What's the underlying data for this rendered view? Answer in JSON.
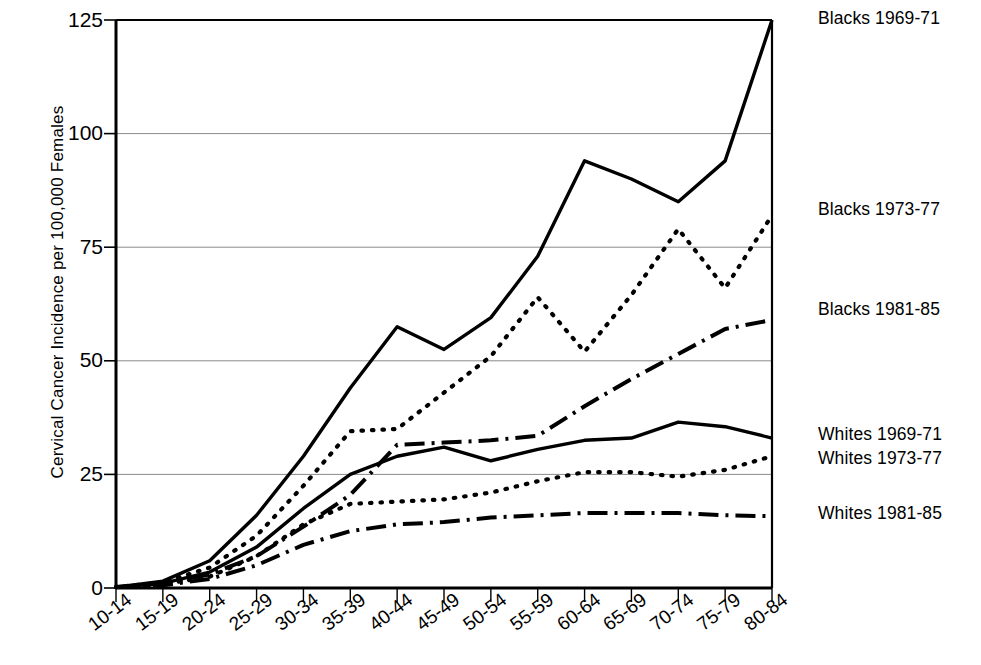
{
  "chart_data": {
    "type": "line",
    "title": "",
    "xlabel": "",
    "ylabel": "Cervical Cancer Incidence per 100,000 Females",
    "categories": [
      "10-14",
      "15-19",
      "20-24",
      "25-29",
      "30-34",
      "35-39",
      "40-44",
      "45-49",
      "50-54",
      "55-59",
      "60-64",
      "65-69",
      "70-74",
      "75-79",
      "80-84"
    ],
    "ylim": [
      0,
      125
    ],
    "yticks": [
      0,
      25,
      50,
      75,
      100,
      125
    ],
    "grid": true,
    "legend_position": "right",
    "series": [
      {
        "name": "Blacks 1969-71",
        "style": "solid",
        "values": [
          0.2,
          1.5,
          6.0,
          16.0,
          29.0,
          44.0,
          57.5,
          52.5,
          59.5,
          73.0,
          94.0,
          90.0,
          85.0,
          94.0,
          125.0
        ]
      },
      {
        "name": "Blacks 1973-77",
        "style": "dotted",
        "values": [
          0.2,
          1.2,
          4.5,
          11.5,
          22.5,
          34.5,
          35.0,
          43.0,
          51.0,
          64.0,
          52.0,
          64.5,
          79.0,
          66.0,
          82.0
        ]
      },
      {
        "name": "Blacks 1981-85",
        "style": "dash-dot",
        "values": [
          0.2,
          1.0,
          3.0,
          7.0,
          13.5,
          20.5,
          31.5,
          32.0,
          32.5,
          33.5,
          40.0,
          46.0,
          51.5,
          57.0,
          59.0
        ]
      },
      {
        "name": "Whites 1969-71",
        "style": "solid",
        "values": [
          0.2,
          1.0,
          3.5,
          9.0,
          17.5,
          25.0,
          29.0,
          31.0,
          28.0,
          30.5,
          32.5,
          33.0,
          36.5,
          35.5,
          33.0
        ]
      },
      {
        "name": "Whites 1973-77",
        "style": "dotted",
        "values": [
          0.2,
          0.8,
          2.5,
          7.0,
          14.0,
          18.5,
          19.0,
          19.5,
          21.0,
          23.5,
          25.5,
          25.5,
          24.5,
          26.0,
          29.0
        ]
      },
      {
        "name": "Whites 1981-85",
        "style": "dash-dot",
        "values": [
          0.2,
          0.6,
          2.0,
          5.0,
          9.5,
          12.5,
          14.0,
          14.5,
          15.5,
          16.0,
          16.5,
          16.5,
          16.5,
          16.0,
          15.8
        ]
      }
    ]
  },
  "legend": {
    "entries": [
      {
        "label": "Blacks 1969-71",
        "top": 8
      },
      {
        "label": "Blacks 1973-77",
        "top": 199
      },
      {
        "label": "Blacks 1981-85",
        "top": 299
      },
      {
        "label": "Whites 1969-71",
        "top": 424
      },
      {
        "label": "Whites 1973-77",
        "top": 448
      },
      {
        "label": "Whites 1981-85",
        "top": 503
      }
    ]
  },
  "axes": {
    "y_axis_title": "Cervical Cancer Incidence per 100,000 Females",
    "y_tick_labels": [
      "125",
      "100",
      "75",
      "50",
      "25",
      "0"
    ],
    "x_tick_labels": [
      "10-14",
      "15-19",
      "20-24",
      "25-29",
      "30-34",
      "35-39",
      "40-44",
      "45-49",
      "50-54",
      "55-59",
      "60-64",
      "65-69",
      "70-74",
      "75-79",
      "80-84"
    ]
  }
}
